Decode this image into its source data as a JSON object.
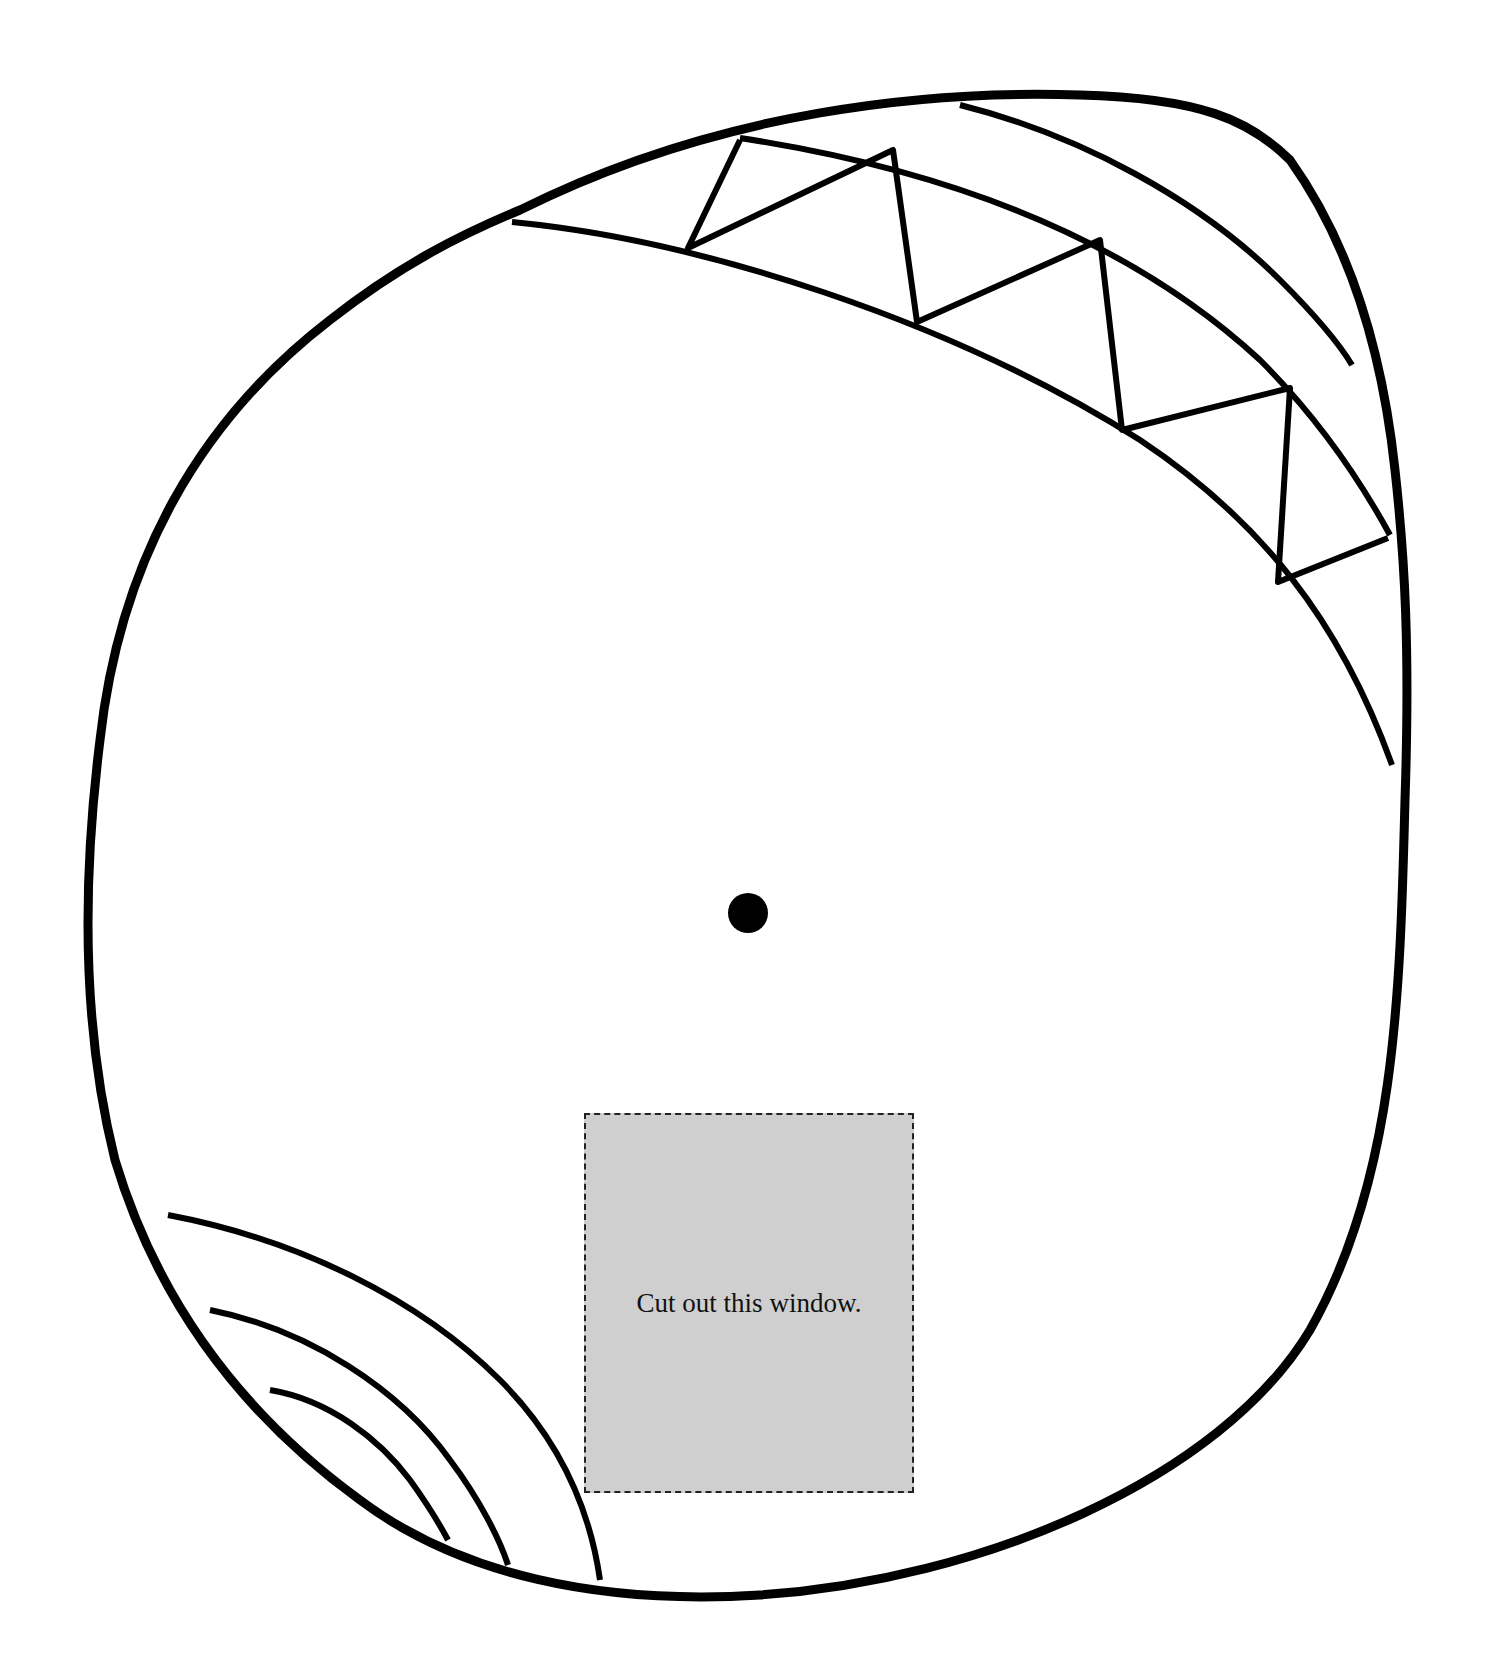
{
  "diagram": {
    "type": "cut-out template wheel",
    "colors": {
      "stroke": "#000000",
      "background": "#ffffff",
      "window_fill": "#cfcfcf",
      "window_border": "#222222"
    },
    "outer_shape": "rounded irregular circle outline",
    "center_marker": "filled black dot (pivot point)",
    "top_band": {
      "description": "curved band along upper-right edge with zig-zag triangle lattice",
      "triangle_count": 8
    },
    "bottom_left_arcs": {
      "description": "three nested arcs in lower-left segment",
      "count": 3
    },
    "cut_window": {
      "label": "Cut out this window.",
      "border_style": "dashed"
    }
  }
}
